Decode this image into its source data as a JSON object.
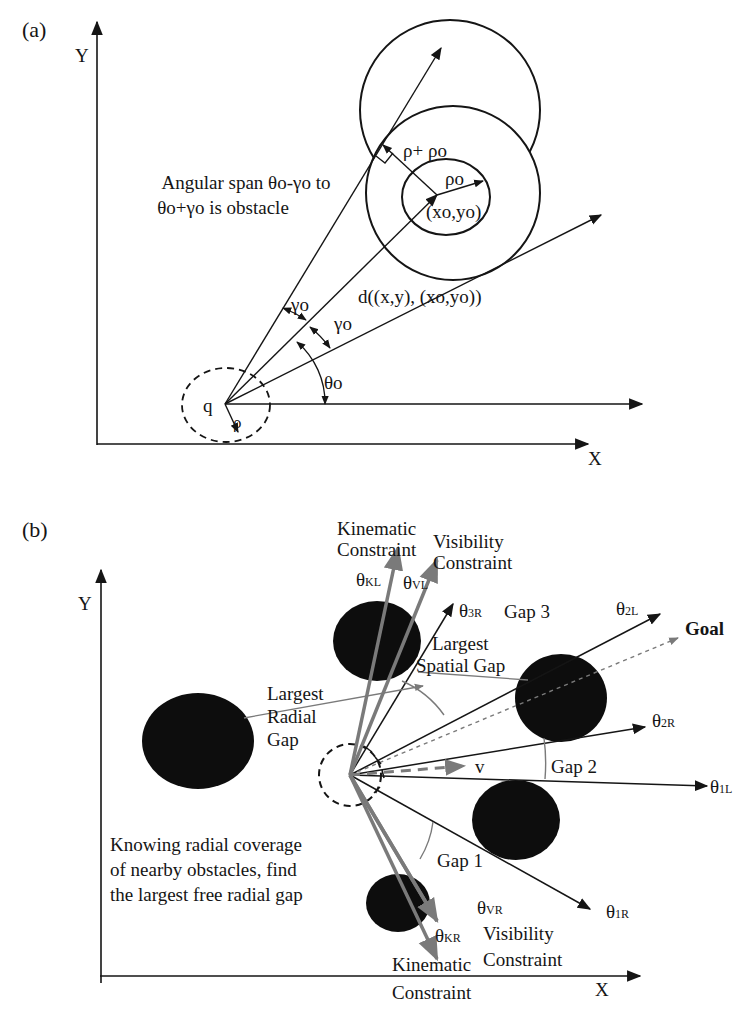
{
  "figure": {
    "panel_a": {
      "tag": "(a)",
      "axis_y": "Y",
      "axis_x": "X",
      "annotation_line1": "Angular span θo-γo to",
      "annotation_line2": "θo+γo is obstacle",
      "rho_plus_rho_o": "ρ+ ρo",
      "rho_o": "ρo",
      "obstacle_center": "(xo,yo)",
      "distance_label": "d((x,y), (xo,yo))",
      "gamma_o_1": "γo",
      "gamma_o_2": "γo",
      "theta_o": "θo",
      "robot_label": "q",
      "robot_radius": "ρ"
    },
    "panel_b": {
      "tag": "(b)",
      "axis_y": "Y",
      "axis_x": "X",
      "kinematic_top_1": "Kinematic",
      "kinematic_top_2": "Constraint",
      "visibility_top_1": "Visibility",
      "visibility_top_2": "Constraint",
      "theta_KL": "θKL",
      "theta_VL": "θVL",
      "theta_3R": "θ3R",
      "gap3": "Gap 3",
      "theta_2L": "θ2L",
      "goal": "Goal",
      "largest_spatial_1": "Largest",
      "largest_spatial_2": "Spatial Gap",
      "largest_radial_1": "Largest",
      "largest_radial_2": "Radial",
      "largest_radial_3": "Gap",
      "theta_2R": "θ2R",
      "velocity": "v",
      "gap2": "Gap 2",
      "theta_1L": "θ1L",
      "gap1": "Gap 1",
      "theta_1R": "θ1R",
      "theta_VR": "θVR",
      "visibility_bottom_1": "Visibility",
      "visibility_bottom_2": "Constraint",
      "theta_KR": "θKR",
      "kinematic_bottom_1": "Kinematic",
      "kinematic_bottom_2": "Constraint",
      "note_line1": "Knowing radial coverage",
      "note_line2": "of nearby obstacles, find",
      "note_line3": "the largest free radial gap"
    },
    "colors": {
      "ink": "#151515",
      "gray_arrow": "#7a7a7a",
      "obstacle": "#0d0d0d"
    }
  }
}
